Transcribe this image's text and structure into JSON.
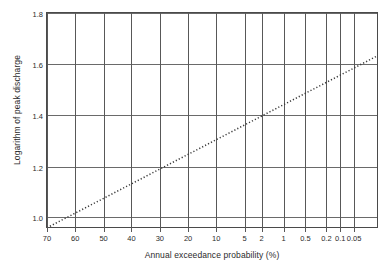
{
  "chart_data": {
    "type": "line",
    "title": "",
    "xlabel": "Annual exceedance probability (%)",
    "ylabel": "Logarithm of peak discharge",
    "grid": true,
    "legend": false,
    "x_scale": "probability (reversed, Gumbel/normal probability paper)",
    "x_tick_labels": [
      "70",
      "60",
      "50",
      "40",
      "30",
      "20",
      "10",
      "5",
      "2",
      "1",
      "0.5",
      "0.2",
      "0.1",
      "0.05"
    ],
    "x_tick_values": [
      70,
      60,
      50,
      40,
      30,
      20,
      10,
      5,
      2,
      1,
      0.5,
      0.2,
      0.1,
      0.05
    ],
    "x_tick_positions_frac": [
      0.0,
      0.0855,
      0.1715,
      0.256,
      0.342,
      0.4275,
      0.494,
      0.512,
      0.6505,
      0.717,
      0.783,
      0.8465,
      0.8885,
      0.9305
    ],
    "ylim": [
      0.93,
      1.83
    ],
    "y_tick_labels": [
      "1.0",
      "1.2",
      "1.4",
      "1.6",
      "1.8"
    ],
    "y_tick_values": [
      1.0,
      1.2,
      1.4,
      1.6,
      1.8
    ],
    "y_gridline_positions_frac": [
      0.954,
      0.718,
      0.477,
      0.236,
      0.0
    ],
    "series": [
      {
        "name": "Fitted frequency line",
        "style": "dotted",
        "color": "#3a3a3a",
        "points": [
          {
            "x_label": "70",
            "x_frac": 0.0,
            "y": 0.935
          },
          {
            "x_label": "50",
            "x_frac": 0.1715,
            "y": 1.0
          },
          {
            "x_label": "20",
            "x_frac": 0.4275,
            "y": 1.2
          },
          {
            "x_label": "2",
            "x_frac": 0.6505,
            "y": 1.4
          },
          {
            "x_label": "0.05",
            "x_frac": 0.9305,
            "y": 1.6
          },
          {
            "x_label": "",
            "x_frac": 1.0,
            "y": 1.655
          }
        ],
        "annotations": [
          "Line passes through 1.0 at about 52% exceedance probability",
          "Line passes through 1.2 at about 17% exceedance probability",
          "Line passes through 1.4 at about 1.3% exceedance probability",
          "Line passes through 1.6 at about 0.06% exceedance probability"
        ]
      }
    ]
  },
  "axes": {
    "y_title": "Logarithm of peak discharge",
    "x_title": "Annual exceedance probability (%)",
    "y_ticks": [
      {
        "label": "1.8"
      },
      {
        "label": "1.6"
      },
      {
        "label": "1.4"
      },
      {
        "label": "1.2"
      },
      {
        "label": "1.0"
      }
    ],
    "x_ticks": [
      {
        "label": "70"
      },
      {
        "label": "60"
      },
      {
        "label": "50"
      },
      {
        "label": "40"
      },
      {
        "label": "30"
      },
      {
        "label": "20"
      },
      {
        "label": "10"
      },
      {
        "label": "5"
      },
      {
        "label": "2"
      },
      {
        "label": "1"
      },
      {
        "label": "0.5"
      },
      {
        "label": "0.2"
      },
      {
        "label": "0.1"
      },
      {
        "label": "0.05"
      }
    ]
  },
  "colors": {
    "frame": "#4a4a4a",
    "gridline_vertical": "#585858",
    "gridline_horizontal": "#6a6a6a",
    "series": "#3a3a3a",
    "text": "#2b2b2b",
    "background": "#ffffff"
  }
}
